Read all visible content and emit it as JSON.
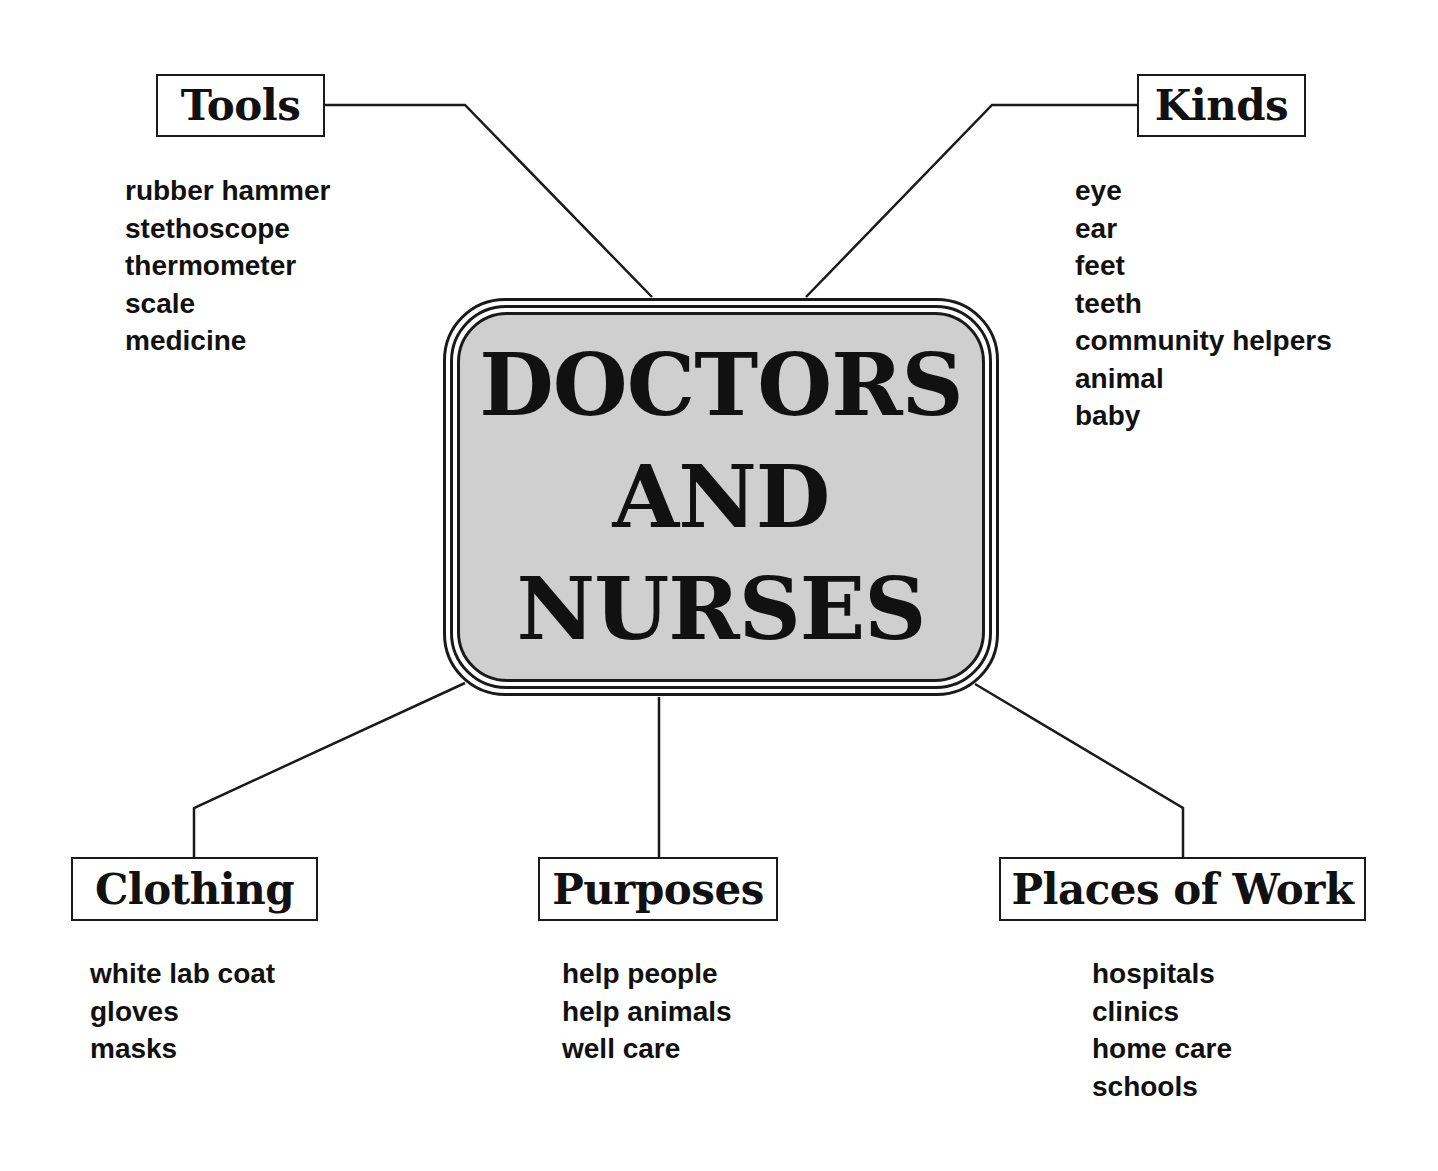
{
  "center": {
    "lines": [
      "DOCTORS",
      "AND",
      "NURSES"
    ],
    "fill_color": "#cfcfcf"
  },
  "branches": {
    "tools": {
      "label": "Tools",
      "items": [
        "rubber hammer",
        "stethoscope",
        "thermometer",
        "scale",
        "medicine"
      ]
    },
    "kinds": {
      "label": "Kinds",
      "items": [
        "eye",
        "ear",
        "feet",
        "teeth",
        "community helpers",
        "animal",
        "baby"
      ]
    },
    "clothing": {
      "label": "Clothing",
      "items": [
        "white lab coat",
        "gloves",
        "masks"
      ]
    },
    "purposes": {
      "label": "Purposes",
      "items": [
        "help people",
        "help animals",
        "well care"
      ]
    },
    "places_of_work": {
      "label": "Places of Work",
      "items": [
        "hospitals",
        "clinics",
        "home care",
        "schools"
      ]
    }
  }
}
